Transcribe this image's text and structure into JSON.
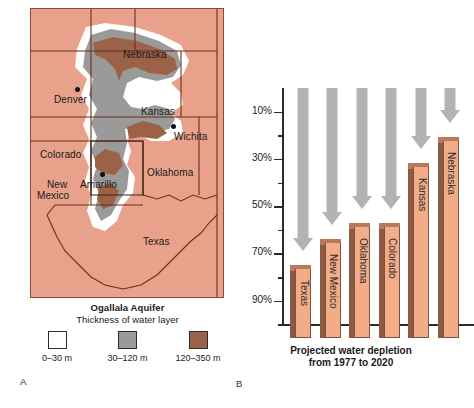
{
  "panel_a": {
    "label": "A",
    "legend": {
      "title": "Ogallala Aquifer",
      "subtitle": "Thickness of water layer",
      "items": [
        {
          "swatch": "white-swatch",
          "caption": "0–30 m"
        },
        {
          "swatch": "gray-swatch",
          "caption": "30–120 m"
        },
        {
          "swatch": "brown-swatch",
          "caption": "120–350 m"
        }
      ]
    },
    "states": [
      {
        "name": "Nebraska",
        "x": 92,
        "y": 40
      },
      {
        "name": "Kansas",
        "x": 110,
        "y": 97
      },
      {
        "name": "Colorado",
        "x": 13,
        "y": 140
      },
      {
        "name": "Wichita",
        "x": 145,
        "y": 125
      },
      {
        "name": "Oklahoma",
        "x": 115,
        "y": 158
      },
      {
        "name": "New",
        "x": 15,
        "y": 170
      },
      {
        "name": "Mexico",
        "x": 8,
        "y": 182
      },
      {
        "name": "Denver",
        "x": 22,
        "y": 88
      },
      {
        "name": "Amarillo",
        "x": 62,
        "y": 172
      },
      {
        "name": "Texas",
        "x": 110,
        "y": 228
      }
    ],
    "cities": [
      {
        "name": "Denver",
        "x": 44,
        "y": 78
      },
      {
        "name": "Wichita",
        "x": 140,
        "y": 115
      },
      {
        "name": "Amarillo",
        "x": 69,
        "y": 163
      }
    ],
    "colors": {
      "plains": "#e8a18a",
      "thin": "#ffffff",
      "medium": "#9a9a9a",
      "thick": "#9c6247",
      "border": "#8a4a33"
    }
  },
  "panel_b": {
    "label": "B",
    "caption_line1": "Projected water depletion",
    "caption_line2": "from 1977 to 2020"
  },
  "chart_data": {
    "type": "bar",
    "title": "Projected water depletion from 1977 to 2020",
    "xlabel": "",
    "ylabel": "",
    "ylim": [
      0,
      100
    ],
    "y_inverted": true,
    "ytick_labels": [
      "10%",
      "30%",
      "50%",
      "70%",
      "90%"
    ],
    "ytick_values": [
      10,
      30,
      50,
      70,
      90
    ],
    "yminor_values": [
      20,
      40,
      60,
      80,
      100
    ],
    "grid": false,
    "legend": "none",
    "units": "percent depletion",
    "categories": [
      "Texas",
      "New Mexico",
      "Oklahoma",
      "Colorado",
      "Kansas",
      "Nebraska"
    ],
    "values": [
      69,
      58,
      51,
      51,
      26,
      15
    ],
    "annotation": "Gray downward arrows above each bar indicate direction of depletion"
  }
}
